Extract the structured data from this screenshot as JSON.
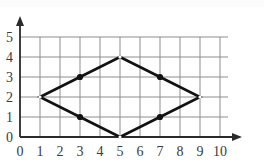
{
  "figure": {
    "kind": "coordinate-grid-plot",
    "width": 264,
    "height": 165,
    "background": "#ffffff"
  },
  "axes": {
    "origin_px": {
      "x": 20,
      "y": 137
    },
    "cell_px": 20,
    "x_label_values": [
      "0",
      "1",
      "2",
      "3",
      "4",
      "5",
      "6",
      "7",
      "8",
      "9",
      "10"
    ],
    "y_label_values": [
      "0",
      "1",
      "2",
      "3",
      "4",
      "5"
    ],
    "axis_color": "#2b2b2b",
    "grid_color": "#8d8d8d",
    "label_color": "#3a3a3a",
    "arrow_x": "right-arrow-icon",
    "arrow_y": "up-arrow-icon"
  },
  "chart_data": {
    "type": "line",
    "title": "",
    "xlabel": "",
    "ylabel": "",
    "xlim": [
      0,
      10
    ],
    "ylim": [
      0,
      5
    ],
    "xticks": [
      0,
      1,
      2,
      3,
      4,
      5,
      6,
      7,
      8,
      9,
      10
    ],
    "yticks": [
      0,
      1,
      2,
      3,
      4,
      5
    ],
    "grid": true,
    "legend": "none",
    "series": [
      {
        "name": "closed-polygon",
        "closed": true,
        "stroke": "#111111",
        "stroke_width": 2.6,
        "x": [
          1,
          3,
          5,
          7,
          9,
          7,
          5,
          3
        ],
        "y": [
          2,
          3,
          4,
          3,
          2,
          1,
          0,
          1
        ]
      }
    ],
    "points": [
      {
        "label": "A",
        "x": 1,
        "y": 2,
        "marker": "open"
      },
      {
        "label": "B",
        "x": 3,
        "y": 3,
        "marker": "filled"
      },
      {
        "label": "C",
        "x": 5,
        "y": 4,
        "marker": "open"
      },
      {
        "label": "D",
        "x": 7,
        "y": 3,
        "marker": "filled"
      },
      {
        "label": "E",
        "x": 9,
        "y": 2,
        "marker": "open"
      },
      {
        "label": "F",
        "x": 7,
        "y": 1,
        "marker": "filled"
      },
      {
        "label": "G",
        "x": 5,
        "y": 0,
        "marker": "open"
      },
      {
        "label": "H",
        "x": 3,
        "y": 1,
        "marker": "filled"
      }
    ],
    "marker_color": "#111111",
    "marker_radius": 3.1
  }
}
